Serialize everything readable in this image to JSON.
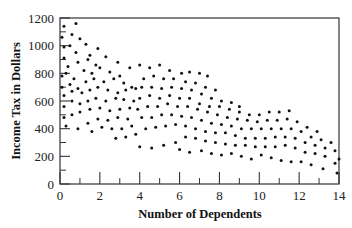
{
  "chart_data": {
    "type": "scatter",
    "title": "",
    "xlabel": "Number of Dependents",
    "ylabel": "Income Tax in Dollars",
    "xlim": [
      0,
      14
    ],
    "ylim": [
      0,
      1200
    ],
    "x_ticks": [
      0,
      2,
      4,
      6,
      8,
      10,
      12,
      14
    ],
    "x_minor_ticks": [
      1,
      3,
      5,
      7,
      9,
      11,
      13
    ],
    "y_ticks": [
      0,
      200,
      400,
      600,
      800,
      1000,
      1200
    ],
    "y_minor_ticks": [
      100,
      300,
      500,
      700,
      900,
      1100
    ],
    "grid": false,
    "legend": null,
    "marker_color": "#111111",
    "series": [
      {
        "name": "observations",
        "points": [
          [
            0.2,
            1140
          ],
          [
            0.8,
            1160
          ],
          [
            0.1,
            1060
          ],
          [
            0.6,
            1080
          ],
          [
            1.0,
            1050
          ],
          [
            1.3,
            1010
          ],
          [
            0.2,
            990
          ],
          [
            0.5,
            1000
          ],
          [
            0.8,
            950
          ],
          [
            1.5,
            930
          ],
          [
            1.9,
            980
          ],
          [
            0.2,
            910
          ],
          [
            0.4,
            850
          ],
          [
            0.9,
            880
          ],
          [
            1.4,
            900
          ],
          [
            1.8,
            860
          ],
          [
            2.3,
            920
          ],
          [
            2.9,
            880
          ],
          [
            0.1,
            780
          ],
          [
            0.3,
            800
          ],
          [
            0.7,
            760
          ],
          [
            1.2,
            820
          ],
          [
            1.6,
            800
          ],
          [
            2.0,
            840
          ],
          [
            2.5,
            810
          ],
          [
            3.0,
            780
          ],
          [
            3.5,
            840
          ],
          [
            4.0,
            860
          ],
          [
            0.1,
            700
          ],
          [
            0.5,
            720
          ],
          [
            0.9,
            690
          ],
          [
            1.3,
            740
          ],
          [
            1.7,
            760
          ],
          [
            2.2,
            740
          ],
          [
            2.7,
            760
          ],
          [
            3.2,
            730
          ],
          [
            3.6,
            700
          ],
          [
            4.5,
            840
          ],
          [
            5.0,
            860
          ],
          [
            5.5,
            820
          ],
          [
            6.1,
            800
          ],
          [
            6.5,
            810
          ],
          [
            7.0,
            800
          ],
          [
            7.4,
            780
          ],
          [
            0.2,
            640
          ],
          [
            0.6,
            670
          ],
          [
            1.1,
            660
          ],
          [
            1.5,
            680
          ],
          [
            1.9,
            700
          ],
          [
            2.4,
            680
          ],
          [
            2.9,
            660
          ],
          [
            3.3,
            680
          ],
          [
            3.8,
            690
          ],
          [
            4.2,
            760
          ],
          [
            4.7,
            780
          ],
          [
            5.2,
            760
          ],
          [
            5.7,
            760
          ],
          [
            6.3,
            740
          ],
          [
            6.8,
            730
          ],
          [
            7.3,
            700
          ],
          [
            7.8,
            680
          ],
          [
            0.2,
            560
          ],
          [
            0.6,
            600
          ],
          [
            1.0,
            580
          ],
          [
            1.4,
            600
          ],
          [
            1.8,
            620
          ],
          [
            2.3,
            600
          ],
          [
            2.8,
            620
          ],
          [
            3.2,
            610
          ],
          [
            3.7,
            600
          ],
          [
            4.1,
            700
          ],
          [
            4.6,
            700
          ],
          [
            5.1,
            690
          ],
          [
            5.6,
            700
          ],
          [
            6.1,
            690
          ],
          [
            6.6,
            680
          ],
          [
            7.1,
            650
          ],
          [
            7.6,
            620
          ],
          [
            8.1,
            600
          ],
          [
            8.6,
            590
          ],
          [
            9.0,
            560
          ],
          [
            0.2,
            480
          ],
          [
            0.6,
            500
          ],
          [
            1.0,
            520
          ],
          [
            1.5,
            540
          ],
          [
            2.0,
            550
          ],
          [
            2.5,
            530
          ],
          [
            3.0,
            540
          ],
          [
            3.5,
            550
          ],
          [
            4.0,
            620
          ],
          [
            4.5,
            640
          ],
          [
            5.0,
            620
          ],
          [
            5.5,
            640
          ],
          [
            6.0,
            620
          ],
          [
            6.5,
            620
          ],
          [
            7.0,
            580
          ],
          [
            7.5,
            560
          ],
          [
            8.0,
            560
          ],
          [
            8.5,
            540
          ],
          [
            9.0,
            520
          ],
          [
            9.5,
            500
          ],
          [
            10.0,
            500
          ],
          [
            10.5,
            520
          ],
          [
            11.0,
            520
          ],
          [
            11.5,
            530
          ],
          [
            0.3,
            420
          ],
          [
            0.9,
            400
          ],
          [
            1.4,
            440
          ],
          [
            1.9,
            470
          ],
          [
            2.4,
            460
          ],
          [
            2.9,
            480
          ],
          [
            3.4,
            470
          ],
          [
            3.9,
            540
          ],
          [
            4.4,
            560
          ],
          [
            4.9,
            560
          ],
          [
            5.4,
            580
          ],
          [
            5.9,
            560
          ],
          [
            6.4,
            560
          ],
          [
            6.9,
            540
          ],
          [
            7.4,
            520
          ],
          [
            7.9,
            500
          ],
          [
            8.4,
            480
          ],
          [
            8.9,
            470
          ],
          [
            9.4,
            460
          ],
          [
            9.9,
            450
          ],
          [
            10.4,
            460
          ],
          [
            10.9,
            460
          ],
          [
            11.4,
            470
          ],
          [
            11.9,
            450
          ],
          [
            12.4,
            410
          ],
          [
            12.9,
            380
          ],
          [
            1.6,
            380
          ],
          [
            2.1,
            410
          ],
          [
            2.6,
            400
          ],
          [
            3.1,
            400
          ],
          [
            3.6,
            420
          ],
          [
            4.1,
            480
          ],
          [
            4.6,
            480
          ],
          [
            5.1,
            500
          ],
          [
            5.6,
            500
          ],
          [
            6.1,
            490
          ],
          [
            6.6,
            480
          ],
          [
            7.1,
            460
          ],
          [
            7.6,
            440
          ],
          [
            8.1,
            430
          ],
          [
            8.6,
            420
          ],
          [
            9.1,
            400
          ],
          [
            9.6,
            400
          ],
          [
            10.1,
            400
          ],
          [
            10.6,
            400
          ],
          [
            11.1,
            400
          ],
          [
            11.6,
            400
          ],
          [
            12.1,
            380
          ],
          [
            12.6,
            340
          ],
          [
            13.1,
            320
          ],
          [
            13.6,
            300
          ],
          [
            2.8,
            330
          ],
          [
            3.3,
            340
          ],
          [
            3.8,
            360
          ],
          [
            4.3,
            400
          ],
          [
            4.8,
            410
          ],
          [
            5.3,
            420
          ],
          [
            5.8,
            430
          ],
          [
            6.3,
            420
          ],
          [
            6.8,
            400
          ],
          [
            7.3,
            380
          ],
          [
            7.8,
            370
          ],
          [
            8.3,
            370
          ],
          [
            8.8,
            350
          ],
          [
            9.3,
            330
          ],
          [
            9.8,
            330
          ],
          [
            10.3,
            330
          ],
          [
            10.8,
            340
          ],
          [
            11.3,
            340
          ],
          [
            11.8,
            330
          ],
          [
            12.3,
            300
          ],
          [
            12.8,
            280
          ],
          [
            13.3,
            260
          ],
          [
            13.8,
            240
          ],
          [
            4.0,
            270
          ],
          [
            4.6,
            260
          ],
          [
            5.2,
            280
          ],
          [
            5.8,
            300
          ],
          [
            6.3,
            340
          ],
          [
            6.8,
            330
          ],
          [
            7.3,
            310
          ],
          [
            7.8,
            300
          ],
          [
            8.3,
            290
          ],
          [
            8.8,
            280
          ],
          [
            9.3,
            280
          ],
          [
            9.8,
            270
          ],
          [
            10.3,
            270
          ],
          [
            10.8,
            270
          ],
          [
            11.3,
            280
          ],
          [
            11.8,
            260
          ],
          [
            12.3,
            230
          ],
          [
            12.8,
            220
          ],
          [
            13.3,
            200
          ],
          [
            14.0,
            180
          ],
          [
            6.0,
            250
          ],
          [
            6.5,
            230
          ],
          [
            7.1,
            240
          ],
          [
            7.6,
            220
          ],
          [
            8.1,
            210
          ],
          [
            8.6,
            220
          ],
          [
            9.1,
            200
          ],
          [
            9.6,
            180
          ],
          [
            10.1,
            210
          ],
          [
            10.6,
            190
          ],
          [
            11.1,
            170
          ],
          [
            11.6,
            160
          ],
          [
            12.1,
            160
          ],
          [
            12.6,
            140
          ],
          [
            13.2,
            110
          ],
          [
            13.8,
            150
          ],
          [
            13.9,
            80
          ]
        ]
      }
    ]
  },
  "plot": {
    "ylabel": "Income Tax in Dollars",
    "xlabel": "Number of Dependents"
  }
}
